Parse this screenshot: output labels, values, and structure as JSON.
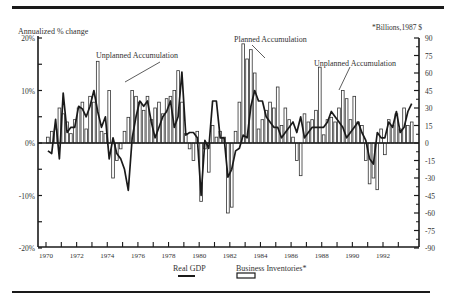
{
  "chart_data": {
    "type": "bar+line",
    "title": "",
    "left_axis": {
      "label": "Annualized % change",
      "ticks": [
        "20%",
        "10%",
        "0%",
        "-10%",
        "-20%"
      ],
      "tick_values": [
        20,
        10,
        0,
        -10,
        -20
      ],
      "range": [
        -20,
        20
      ]
    },
    "right_axis": {
      "label": "*Billions,1987 $",
      "ticks": [
        "90",
        "75",
        "60",
        "45",
        "30",
        "15",
        "0",
        "-15",
        "-30",
        "-45",
        "-60",
        "-75",
        "-90"
      ],
      "tick_values": [
        90,
        75,
        60,
        45,
        30,
        15,
        0,
        -15,
        -30,
        -45,
        -60,
        -75,
        -90
      ],
      "range": [
        -90,
        90
      ]
    },
    "x_axis": {
      "tick_labels": [
        "1970",
        "1972",
        "1974",
        "1976",
        "1978",
        "1980",
        "1982",
        "1984",
        "1986",
        "1988",
        "1990",
        "1992"
      ],
      "start": 1970,
      "end": 1994,
      "frequency": "quarterly"
    },
    "legend": [
      {
        "name": "Real GDP",
        "style": "line"
      },
      {
        "name": "Business Inventories*",
        "style": "hollow-bar"
      }
    ],
    "legend_position": "bottom-center",
    "annotations": [
      {
        "text": "Unplanned Accumulation",
        "near": "1974-1975"
      },
      {
        "text": "Planned Accumulation",
        "near": "1984"
      },
      {
        "text": "Unplanned Accumulation",
        "near": "1989"
      }
    ],
    "series": [
      {
        "name": "Real GDP",
        "axis": "left",
        "unit": "annualized % change",
        "values": [
          -1.5,
          -2,
          4.5,
          -3,
          9.5,
          2,
          3,
          3,
          7,
          6.5,
          5,
          7,
          10,
          6,
          3,
          5,
          -3,
          1,
          -2,
          -3,
          -5,
          -9,
          1,
          5,
          8,
          7,
          8,
          4,
          1,
          3,
          5,
          6,
          8,
          3,
          5,
          13.5,
          1.5,
          2,
          2,
          1,
          -10,
          0.5,
          -1,
          8,
          8,
          1,
          1,
          -6.5,
          -5,
          -1.5,
          -1,
          1.5,
          1,
          7,
          10,
          8,
          8,
          5,
          4,
          3,
          3,
          1,
          2,
          3,
          4,
          2,
          5,
          1,
          2,
          3,
          3,
          3,
          3,
          4,
          6,
          5,
          4,
          3,
          1,
          2,
          3,
          4,
          2,
          0.5,
          -3,
          -4,
          2,
          1,
          1,
          4,
          3,
          6,
          2,
          3,
          6,
          7.5
        ]
      },
      {
        "name": "Business Inventories",
        "axis": "right",
        "unit": "billions 1987 $",
        "values": [
          5,
          10,
          12,
          30,
          25,
          18,
          8,
          20,
          30,
          35,
          12,
          40,
          35,
          70,
          10,
          8,
          45,
          -30,
          -15,
          -5,
          10,
          22,
          45,
          40,
          35,
          28,
          40,
          20,
          30,
          35,
          25,
          38,
          40,
          45,
          62,
          35,
          8,
          -5,
          -15,
          10,
          -50,
          -5,
          -25,
          15,
          5,
          10,
          5,
          -60,
          -55,
          10,
          35,
          85,
          72,
          80,
          60,
          12,
          20,
          28,
          35,
          30,
          48,
          15,
          30,
          20,
          5,
          -15,
          -28,
          25,
          18,
          20,
          28,
          65,
          7,
          20,
          22,
          18,
          30,
          45,
          38,
          20,
          40,
          18,
          15,
          -15,
          -35,
          -30,
          -40,
          12,
          -10,
          20,
          15,
          25,
          12,
          30,
          15,
          18
        ]
      }
    ]
  },
  "labels": {
    "left_title": "Annualized % change",
    "right_title": "*Billions,1987 $",
    "annotation_1": "Unplanned Accumulation",
    "annotation_2": "Planned Accumulation",
    "annotation_3": "Unplanned Accumulation",
    "legend_gdp": "Real GDP",
    "legend_inv": "Business Inventories*"
  },
  "colors": {
    "ink": "#1a1a1a",
    "bar_fill": "#ffffff"
  }
}
